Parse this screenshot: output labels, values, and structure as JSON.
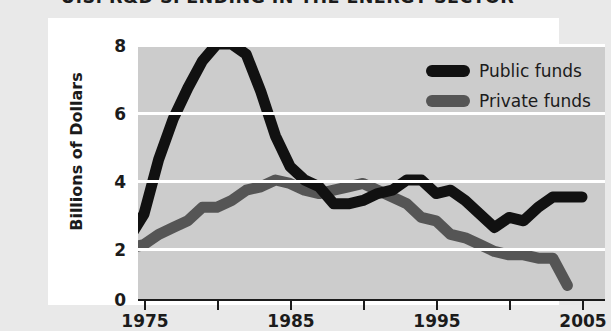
{
  "title": "U.S. R&D SPENDING IN THE ENERGY SECTOR",
  "legend": {
    "public_label": "Public funds",
    "private_label": "Private funds",
    "public_color": "#111111",
    "private_color": "#555555"
  },
  "axes": {
    "ylabel": "Billions of Dollars",
    "ytick_labels": [
      "8",
      "6",
      "4",
      "2",
      "0"
    ],
    "xtick_labels": [
      "1975",
      "",
      "1985",
      "",
      "1995",
      "",
      "2005"
    ]
  },
  "colors": {
    "page_background": "#e9e9e9",
    "card_background": "#ffffff",
    "plot_background": "#cccccc",
    "gridline": "#ffffff",
    "axis": "#1b1b1b"
  },
  "chart_data": {
    "type": "line",
    "title": "U.S. R&D SPENDING IN THE ENERGY SECTOR",
    "xlabel": "",
    "ylabel": "Billions of Dollars",
    "xlim": [
      1974,
      2006
    ],
    "ylim": [
      0,
      8.5
    ],
    "grid": true,
    "gridlines_y": [
      2,
      4,
      6,
      8
    ],
    "legend_position": "upper-right",
    "xticks": [
      1975,
      1980,
      1985,
      1990,
      1995,
      2000,
      2005
    ],
    "xtick_labels": [
      "1975",
      "",
      "1985",
      "",
      "1995",
      "",
      "2005"
    ],
    "yticks": [
      0,
      2,
      4,
      6,
      8
    ],
    "series": [
      {
        "name": "Public funds",
        "color": "#111111",
        "x": [
          1974,
          1975,
          1976,
          1977,
          1978,
          1979,
          1980,
          1981,
          1982,
          1983,
          1984,
          1985,
          1986,
          1987,
          1988,
          1989,
          1990,
          1991,
          1992,
          1993,
          1994,
          1995,
          1996,
          1997,
          1998,
          1999,
          2000,
          2001,
          2002,
          2003,
          2004,
          2005
        ],
        "values": [
          2.3,
          3.0,
          4.6,
          5.8,
          6.7,
          7.5,
          8.0,
          8.0,
          7.7,
          6.6,
          5.3,
          4.4,
          4.0,
          3.8,
          3.3,
          3.3,
          3.4,
          3.6,
          3.7,
          4.0,
          4.0,
          3.6,
          3.7,
          3.4,
          3.0,
          2.6,
          2.9,
          2.8,
          3.2,
          3.5,
          3.5,
          3.5
        ]
      },
      {
        "name": "Private funds",
        "color": "#555555",
        "x": [
          1974,
          1975,
          1976,
          1977,
          1978,
          1979,
          1980,
          1981,
          1982,
          1983,
          1984,
          1985,
          1986,
          1987,
          1988,
          1989,
          1990,
          1991,
          1992,
          1993,
          1994,
          1995,
          1996,
          1997,
          1998,
          1999,
          2000,
          2001,
          2002,
          2003,
          2004
        ],
        "values": [
          2.0,
          2.1,
          2.4,
          2.6,
          2.8,
          3.2,
          3.2,
          3.4,
          3.7,
          3.8,
          4.0,
          3.9,
          3.7,
          3.6,
          3.7,
          3.8,
          3.9,
          3.7,
          3.5,
          3.3,
          2.9,
          2.8,
          2.4,
          2.3,
          2.1,
          1.9,
          1.8,
          1.8,
          1.7,
          1.7,
          0.9
        ]
      }
    ]
  }
}
